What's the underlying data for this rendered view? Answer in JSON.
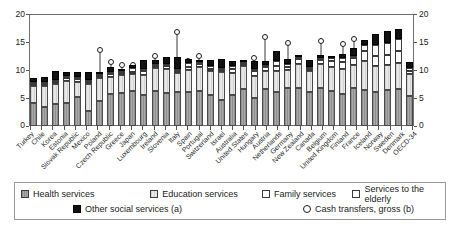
{
  "chart_data": {
    "type": "bar",
    "stacked": true,
    "title": "",
    "xlabel": "",
    "ylabel": "",
    "ylim": [
      0,
      20
    ],
    "yticks": [
      0,
      5,
      10,
      15,
      20
    ],
    "ytick_labels": [
      "0",
      "5",
      "10",
      "15",
      "20"
    ],
    "right_axis": true,
    "grid": false,
    "legend_position": "bottom",
    "categories": [
      "Turkey",
      "Chile",
      "Korea",
      "Estonia",
      "Slovak Republic",
      "Mexico",
      "Poland",
      "Czech Republic",
      "Greece",
      "Japan",
      "Luxembourg",
      "Ireland",
      "Slovenia",
      "Italy",
      "Spain",
      "Portugal",
      "Switzerland",
      "Israel",
      "Australia",
      "United States",
      "Hungary",
      "Austria",
      "Netherlands",
      "Germany",
      "New Zealand",
      "Canada",
      "Belgium",
      "United Kingdom",
      "Finland",
      "France",
      "Iceland",
      "Norway",
      "Sweden",
      "Denmark",
      "OECD-34"
    ],
    "series": [
      {
        "name": "Health services",
        "values": [
          4.1,
          3.4,
          3.9,
          4.2,
          5.2,
          2.7,
          4.5,
          5.8,
          5.9,
          6.3,
          5.5,
          6.3,
          5.9,
          6.1,
          6.2,
          6.3,
          5.6,
          4.6,
          5.6,
          6.6,
          5.1,
          6.6,
          6.1,
          6.8,
          6.9,
          6.2,
          6.9,
          6.3,
          5.8,
          6.9,
          6.5,
          6.1,
          6.4,
          6.6,
          5.4
        ]
      },
      {
        "name": "Education services",
        "values": [
          3.1,
          3.8,
          3.6,
          3.9,
          2.8,
          4.9,
          4.1,
          3.1,
          3.3,
          3.1,
          3.7,
          4.1,
          4.3,
          3.4,
          3.9,
          4.4,
          4.4,
          5.2,
          3.9,
          4.2,
          3.9,
          3.4,
          3.9,
          3.3,
          4.3,
          3.8,
          4.2,
          4.3,
          4.4,
          4.1,
          5.2,
          4.7,
          4.6,
          4.7,
          3.9
        ]
      },
      {
        "name": "Family services",
        "values": [
          0.2,
          0.3,
          0.3,
          0.5,
          0.4,
          0.2,
          0.3,
          0.5,
          0.2,
          0.4,
          0.8,
          0.4,
          0.6,
          0.2,
          0.6,
          0.4,
          0.3,
          0.3,
          0.7,
          0.3,
          0.9,
          0.6,
          0.8,
          0.5,
          0.8,
          0.2,
          0.8,
          1.1,
          1.3,
          1.3,
          1.9,
          1.9,
          1.8,
          2.2,
          0.6
        ]
      },
      {
        "name": "Services to the elderly",
        "values": [
          0.1,
          0.1,
          0.1,
          0.1,
          0.1,
          0.1,
          0.1,
          0.2,
          0.1,
          0.6,
          0.3,
          0.2,
          0.3,
          0.2,
          0.6,
          0.2,
          0.4,
          0.2,
          0.7,
          0.2,
          0.3,
          0.4,
          1.0,
          0.6,
          0.2,
          0.2,
          0.3,
          0.6,
          0.7,
          0.4,
          1.0,
          1.9,
          2.2,
          2.2,
          0.5
        ]
      },
      {
        "name": "Other social services (a)",
        "values": [
          0.7,
          0.9,
          1.7,
          0.8,
          0.9,
          1.5,
          0.4,
          0.9,
          0.4,
          0.6,
          1.5,
          0.8,
          1.3,
          2.2,
          0.8,
          0.5,
          1.2,
          1.5,
          0.9,
          0.4,
          1.5,
          0.8,
          1.7,
          0.9,
          0.2,
          1.1,
          0.6,
          0.4,
          0.7,
          1.3,
          0.9,
          1.9,
          2.1,
          1.8,
          1.1
        ]
      }
    ],
    "overlay": {
      "name": "Cash transfers, gross (b)",
      "marker": "open-circle",
      "values": [
        6.3,
        6.0,
        2.6,
        9.4,
        9.4,
        2.3,
        14.2,
        12.0,
        11.5,
        11.5,
        9.0,
        13.2,
        12.5,
        17.5,
        12.2,
        13.2,
        8.8,
        5.9,
        8.4,
        11.0,
        12.8,
        16.5,
        9.5,
        15.5,
        8.8,
        9.0,
        15.9,
        11.5,
        15.4,
        16.3,
        6.3,
        10.3,
        12.8,
        13.2,
        10.9
      ]
    }
  },
  "legend": {
    "items": [
      {
        "label": "Health services",
        "swatch": "health"
      },
      {
        "label": "Education services",
        "swatch": "education"
      },
      {
        "label": "Family services",
        "swatch": "family"
      },
      {
        "label": "Services to the elderly",
        "swatch": "elderly"
      },
      {
        "label": "Other social services (a)",
        "swatch": "other"
      },
      {
        "label": "Cash transfers, gross (b)",
        "swatch": "circle"
      }
    ]
  },
  "axes": {
    "left_ticks": [
      "20",
      "15",
      "10",
      "5",
      "0"
    ],
    "right_ticks": [
      "20",
      "15",
      "10",
      "5",
      "0"
    ]
  }
}
